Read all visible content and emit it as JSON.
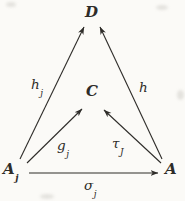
{
  "diagram": {
    "type": "commutative-diagram",
    "nodes": {
      "d": {
        "label": "D"
      },
      "c": {
        "label": "C"
      },
      "a_j": {
        "base": "A",
        "sub": "j"
      },
      "a": {
        "label": "A"
      }
    },
    "edges": {
      "h_j": {
        "base": "h",
        "sub": "j",
        "from": "A_j",
        "to": "D"
      },
      "h": {
        "label": "h",
        "from": "A",
        "to": "D"
      },
      "g_j": {
        "base": "g",
        "sub": "j",
        "from": "A_j",
        "to": "C"
      },
      "tau_J": {
        "base": "τ",
        "sub": "J",
        "from": "A",
        "to": "C"
      },
      "sigma_j": {
        "base": "σ",
        "sub": "j",
        "from": "A_j",
        "to": "A"
      }
    },
    "colors": {
      "ink": "#2e2c29",
      "paper": "#fbfaf7"
    }
  }
}
